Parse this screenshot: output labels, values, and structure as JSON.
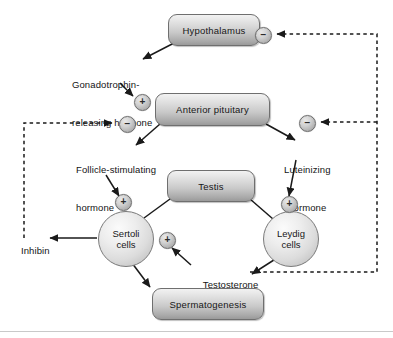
{
  "diagram": {
    "colors": {
      "box_fill_top": "#f2f2f2",
      "box_fill_bottom": "#9a9a9a",
      "box_stroke": "#6f6f6f",
      "circle_stroke": "#7a7a7a",
      "arrow_solid": "#1a1a1a",
      "arrow_dashed": "#1a1a1a",
      "text": "#141414",
      "background": "#ffffff"
    },
    "boxes": [
      {
        "id": "hypothalamus",
        "label": "Hypothalamus"
      },
      {
        "id": "anterior-pituitary",
        "label": "Anterior pituitary"
      },
      {
        "id": "testis",
        "label": "Testis"
      },
      {
        "id": "spermatogenesis",
        "label": "Spermatogenesis"
      }
    ],
    "cells": [
      {
        "id": "sertoli",
        "line1": "Sertoli",
        "line2": "cells"
      },
      {
        "id": "leydig",
        "line1": "Leydig",
        "line2": "cells"
      }
    ],
    "labels": {
      "gnrh_line1": "Gonadotrophin-",
      "gnrh_line2": "releasing hormone",
      "fsh_line1": "Follicle-stimulating",
      "fsh_line2": "hormone",
      "lh_line1": "Luteinizing",
      "lh_line2": "hormone",
      "inhibin": "Inhibin",
      "testosterone": "Testosterone"
    },
    "signs": {
      "hypothalamus_negative": "−",
      "pituitary_positive": "+",
      "pituitary_negative": "−",
      "lh_negative": "−",
      "sertoli_positive": "+",
      "sertoli_testosterone_positive": "+",
      "leydig_positive": "+"
    }
  }
}
